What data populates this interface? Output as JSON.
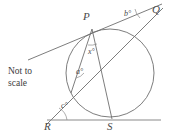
{
  "figure": {
    "note": "Not to\nscale",
    "background_color": "#ffffff",
    "stroke_color": "#6e6e6e",
    "text_color": "#4a4a4a",
    "vertices": [
      {
        "id": "P",
        "label": "P",
        "x": 92,
        "y": 29,
        "label_x": 83,
        "label_y": 11
      },
      {
        "id": "Q",
        "label": "Q",
        "x": 160,
        "y": 5,
        "label_x": 152,
        "label_y": 5
      },
      {
        "id": "R",
        "label": "R",
        "x": 52,
        "y": 120,
        "label_x": 45,
        "label_y": 121
      },
      {
        "id": "S",
        "label": "S",
        "x": 112,
        "y": 120,
        "label_x": 108,
        "label_y": 121
      }
    ],
    "angles": [
      {
        "id": "a",
        "label": "a°",
        "label_x": 78,
        "label_y": 72
      },
      {
        "id": "b",
        "label": "b°",
        "label_x": 124,
        "label_y": 12
      },
      {
        "id": "c",
        "label": "c°",
        "label_x": 62,
        "label_y": 105
      },
      {
        "id": "x",
        "label": "x°",
        "label_x": 92,
        "label_y": 50
      }
    ],
    "circle": {
      "cx": 110,
      "cy": 73,
      "r": 44
    },
    "segments": [
      {
        "id": "tangent-at-P",
        "x1": 28,
        "y1": 60,
        "x2": 160,
        "y2": 5,
        "desc": "tangent line through P to Q"
      },
      {
        "id": "line-R-to-Q",
        "x1": 47,
        "y1": 124,
        "x2": 163,
        "y2": 8,
        "desc": "secant from R through circle to Q"
      },
      {
        "id": "chord-P-to-T",
        "x1": 92,
        "y1": 29,
        "x2": 72,
        "y2": 92,
        "desc": "chord from P to secant intersection"
      },
      {
        "id": "chord-P-to-S",
        "x1": 92,
        "y1": 29,
        "x2": 112,
        "y2": 119,
        "desc": "chord from P to S"
      },
      {
        "id": "base-line-RS",
        "x1": 48,
        "y1": 120,
        "x2": 161,
        "y2": 120,
        "desc": "base tangent line through R and S"
      }
    ],
    "arcs": [
      {
        "id": "arc-angle-b",
        "desc": "small arc marking angle b at Q"
      },
      {
        "id": "arc-angle-c",
        "desc": "small arc marking angle c at R"
      },
      {
        "id": "arc-angle-a",
        "desc": "small arc marking angle a"
      },
      {
        "id": "arc-angle-x",
        "desc": "small arc marking angle x at P"
      }
    ],
    "note_x": 8,
    "note_y": 66
  }
}
